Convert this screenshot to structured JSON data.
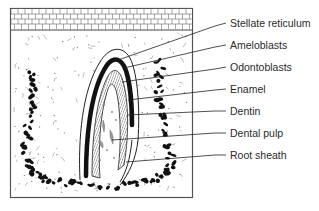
{
  "diagram": {
    "type": "histology-illustration",
    "labels": [
      {
        "id": "stellate-reticulum",
        "text": "Stellate reticulum",
        "y": 23
      },
      {
        "id": "ameloblasts",
        "text": "Ameloblasts",
        "y": 45
      },
      {
        "id": "odontoblasts",
        "text": "Odontoblasts",
        "y": 67
      },
      {
        "id": "enamel",
        "text": "Enamel",
        "y": 89
      },
      {
        "id": "dentin",
        "text": "Dentin",
        "y": 111
      },
      {
        "id": "dental-pulp",
        "text": "Dental pulp",
        "y": 133
      },
      {
        "id": "root-sheath",
        "text": "Root sheath",
        "y": 155
      }
    ],
    "colors": {
      "ink": "#1a1a1a",
      "frame": "#555555",
      "text": "#2a2a2a",
      "background": "#ffffff"
    }
  }
}
